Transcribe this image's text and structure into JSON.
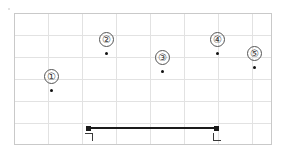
{
  "canvas": {
    "width": 282,
    "height": 159,
    "background": "#ffffff"
  },
  "frame": {
    "x": 14,
    "y": 13,
    "width": 258,
    "height": 132,
    "border_color": "#c9c9c9"
  },
  "grid": {
    "color": "#e2e2e2",
    "visible": true,
    "vertical_x": [
      48,
      82,
      116,
      150,
      184,
      218,
      252
    ],
    "horizontal_y": [
      35,
      57,
      79,
      101,
      123
    ]
  },
  "chart_data": {
    "type": "scatter",
    "title": "",
    "xlabel": "",
    "ylabel": "",
    "grid": true,
    "legend": "none",
    "xlim": [
      14,
      272
    ],
    "ylim": [
      145,
      13
    ],
    "points": [
      {
        "label": "①",
        "number": 1,
        "x": 51,
        "y": 90,
        "label_x": 51,
        "label_y": 76
      },
      {
        "label": "②",
        "number": 2,
        "x": 106,
        "y": 53,
        "label_x": 106,
        "label_y": 39
      },
      {
        "label": "③",
        "number": 3,
        "x": 162,
        "y": 71,
        "label_x": 162,
        "label_y": 57
      },
      {
        "label": "④",
        "number": 4,
        "x": 217,
        "y": 53,
        "label_x": 217,
        "label_y": 39
      },
      {
        "label": "⑤",
        "number": 5,
        "x": 254,
        "y": 67,
        "label_x": 254,
        "label_y": 53
      }
    ],
    "segment": {
      "x1": 88,
      "y1": 128,
      "x2": 216,
      "y2": 128,
      "color": "#1a1a1a",
      "thickness": 2,
      "start_marker": "corner-bracket-open",
      "end_marker": "corner-bracket-l"
    }
  },
  "markers": {
    "left_bracket": {
      "x": 85,
      "y": 133,
      "glyph": "┐"
    },
    "right_bracket": {
      "x": 213,
      "y": 133,
      "glyph": "└"
    }
  },
  "speck": {
    "x": 8,
    "y": 8
  }
}
